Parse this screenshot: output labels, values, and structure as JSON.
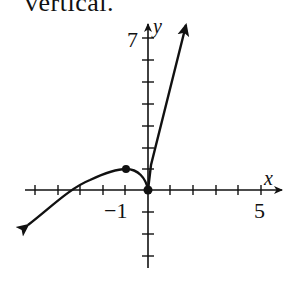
{
  "caption": "vertical.",
  "graph": {
    "x_axis_label": "x",
    "y_axis_label": "y",
    "tick_labels": {
      "y_top": "7",
      "x_neg": "−1",
      "x_pos": "5"
    },
    "points": [
      {
        "x": -1,
        "y": 1,
        "label": "local max"
      },
      {
        "x": 0,
        "y": 0,
        "label": "cusp"
      }
    ],
    "colors": {
      "stroke": "#111111",
      "background": "#ffffff"
    }
  }
}
